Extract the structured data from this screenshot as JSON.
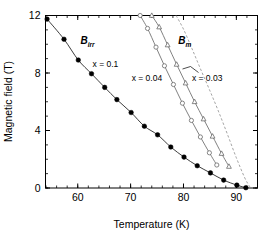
{
  "chart_data": {
    "type": "line",
    "title": "",
    "xlabel": "Temperature (K)",
    "ylabel": "Magnetic field (T)",
    "xlim": [
      53.9,
      94.0
    ],
    "ylim": [
      0,
      12
    ],
    "xticks": [
      60,
      70,
      80,
      90
    ],
    "yticks": [
      0,
      4,
      8,
      12
    ],
    "xtick_labels": [
      "60",
      "70",
      "80",
      "90"
    ],
    "ytick_labels": [
      "0",
      "4",
      "8",
      "12"
    ],
    "x_minor_step": 2,
    "y_minor_step": 1,
    "grid": false,
    "legend": "inline-annotations",
    "annotations": [
      {
        "text": "B",
        "sub": "irr",
        "x": 60.5,
        "y": 10.0,
        "style": "italic-bold"
      },
      {
        "text": "B",
        "sub": "m",
        "x": 79.0,
        "y": 10.0,
        "style": "italic-bold"
      },
      {
        "text": "x = 0.1",
        "x": 62.8,
        "y": 8.45
      },
      {
        "text": "x = 0.04",
        "x": 70.2,
        "y": 7.45
      },
      {
        "text": "x = 0.03",
        "x": 81.6,
        "y": 7.45
      }
    ],
    "series": [
      {
        "name": "B_irr, x = 0.1",
        "label": "x = 0.1",
        "marker": "filled-circle",
        "line": "solid",
        "x": [
          54.2,
          57.4,
          60.1,
          62.6,
          65.1,
          67.4,
          70.1,
          72.6,
          75.1,
          77.6,
          80.1,
          82.6,
          85.1,
          87.6,
          90.1,
          91.8
        ],
        "y": [
          11.75,
          10.35,
          8.9,
          7.95,
          7.0,
          6.15,
          5.25,
          4.3,
          3.7,
          2.85,
          2.15,
          1.55,
          1.05,
          0.55,
          0.2,
          0.02
        ]
      },
      {
        "name": "B_m, x = 0.04",
        "label": "x = 0.04",
        "marker": "open-circle",
        "line": "solid",
        "x": [
          71.8,
          73.2,
          74.8,
          76.4,
          78.1,
          79.8,
          81.5,
          83.2,
          84.9,
          86.3
        ],
        "y": [
          12.0,
          11.1,
          9.8,
          8.5,
          7.2,
          5.9,
          4.7,
          3.55,
          2.45,
          1.6
        ]
      },
      {
        "name": "B_m, x = 0.03 (triangles)",
        "label": "x = 0.03",
        "marker": "open-triangle",
        "line": "solid",
        "x": [
          74.0,
          75.4,
          77.0,
          78.7,
          80.4,
          82.1,
          83.8,
          85.5,
          87.2,
          88.6
        ],
        "y": [
          12.0,
          11.2,
          9.95,
          8.6,
          7.3,
          6.0,
          4.8,
          3.6,
          2.4,
          1.5
        ]
      },
      {
        "name": "B_m, x = 0.03 (dashed guide)",
        "label": "x = 0.03",
        "marker": "none",
        "line": "dashed",
        "x": [
          78.6,
          80.0,
          81.6,
          83.2,
          84.9,
          86.6,
          88.3,
          90.0,
          91.6,
          92.6
        ],
        "y": [
          12.0,
          11.05,
          9.7,
          8.3,
          6.85,
          5.35,
          3.75,
          2.1,
          0.7,
          0.05
        ]
      }
    ]
  },
  "figure": {
    "caption": ""
  }
}
